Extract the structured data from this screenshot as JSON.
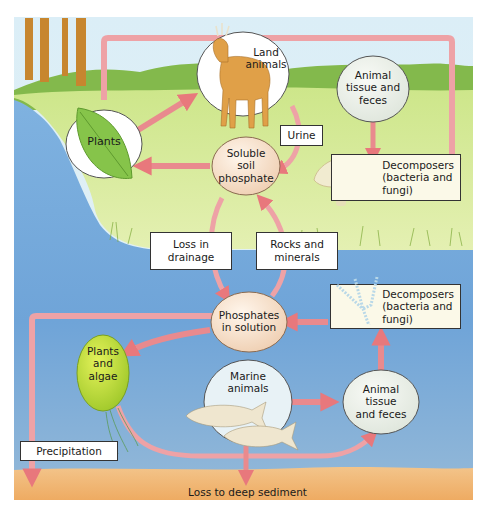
{
  "diagram": {
    "colors": {
      "sky": "#d6eaf3",
      "hills": "#7fb54a",
      "land": "#d9ec9c",
      "water": "#6ea5d8",
      "sediment": "#f0b870",
      "arrow": "#e8878a",
      "arrow_light": "#f0b4b6",
      "node_white": "#ffffff",
      "node_tan": "#f6e2cf",
      "node_grey": "#eef1ea",
      "box_cream": "#fbf9e8",
      "algae": "#c8e23a",
      "tree": "#c7862f"
    },
    "nodes": {
      "land_animals": "Land animals",
      "land_animals_l1": "Land",
      "land_animals_l2": "animals",
      "plants": "Plants",
      "animal_tissue_land_l1": "Animal",
      "animal_tissue_land_l2": "tissue and",
      "animal_tissue_land_l3": "feces",
      "soluble_l1": "Soluble",
      "soluble_l2": "soil",
      "soluble_l3": "phosphate",
      "phosphates_l1": "Phosphates",
      "phosphates_l2": "in solution",
      "plants_algae_l1": "Plants",
      "plants_algae_l2": "and",
      "plants_algae_l3": "algae",
      "marine_l1": "Marine",
      "marine_l2": "animals",
      "animal_tissue_sea_l1": "Animal",
      "animal_tissue_sea_l2": "tissue",
      "animal_tissue_sea_l3": "and feces"
    },
    "boxes": {
      "urine": "Urine",
      "decomposers_land_l1": "Decomposers",
      "decomposers_land_l2": "(bacteria and",
      "decomposers_land_l3": "fungi)",
      "loss_drainage_l1": "Loss in",
      "loss_drainage_l2": "drainage",
      "rocks_l1": "Rocks and",
      "rocks_l2": "minerals",
      "decomposers_sea_l1": "Decomposers",
      "decomposers_sea_l2": "(bacteria and",
      "decomposers_sea_l3": "fungi)",
      "precipitation": "Precipitation"
    },
    "captions": {
      "loss_sediment": "Loss to deep sediment"
    }
  }
}
